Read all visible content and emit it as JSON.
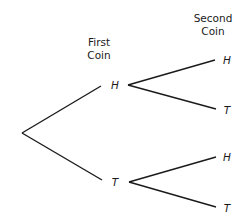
{
  "diagram": {
    "type": "probability-tree",
    "headers": {
      "first_coin": {
        "line1": "First",
        "line2": "Coin"
      },
      "second_coin": {
        "line1": "Second",
        "line2": "Coin"
      }
    },
    "level1": [
      {
        "label": "H"
      },
      {
        "label": "T"
      }
    ],
    "level2": [
      {
        "parent": "H",
        "label": "H"
      },
      {
        "parent": "H",
        "label": "T"
      },
      {
        "parent": "T",
        "label": "H"
      },
      {
        "parent": "T",
        "label": "T"
      }
    ]
  }
}
